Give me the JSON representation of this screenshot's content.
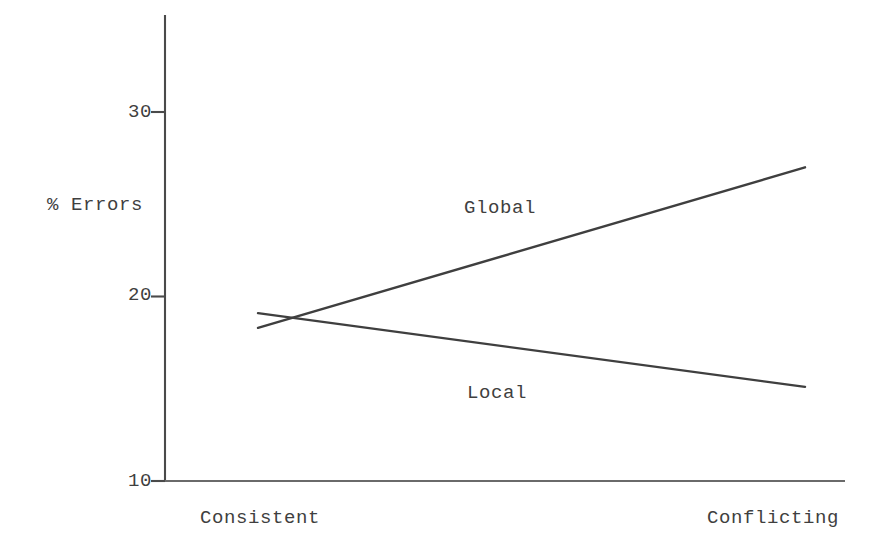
{
  "chart_data": {
    "type": "line",
    "title": "",
    "subtitle": "",
    "xlabel": "",
    "ylabel": "% Errors",
    "categories": [
      "Consistent",
      "Conflicting"
    ],
    "x_tick_labels": [
      "Consistent",
      "Conflicting"
    ],
    "y_tick_labels": [
      "10",
      "20",
      "30"
    ],
    "y_ticks": [
      10,
      20,
      30
    ],
    "ylim": [
      10,
      30
    ],
    "xlim": [
      0,
      1
    ],
    "grid": false,
    "legend": "inline-labels",
    "legend_position": "inline",
    "series": [
      {
        "name": "Global",
        "label": "Global",
        "color": "#3f3f3f",
        "values": [
          18.3,
          27.0
        ],
        "x": [
          "Consistent",
          "Conflicting"
        ]
      },
      {
        "name": "Local",
        "label": "Local",
        "color": "#3f3f3f",
        "values": [
          19.1,
          15.1
        ],
        "x": [
          "Consistent",
          "Conflicting"
        ]
      }
    ],
    "annotations": [
      {
        "text": "Global",
        "series": "Global"
      },
      {
        "text": "Local",
        "series": "Local"
      }
    ]
  },
  "axes": {
    "y_axis_label": "% Errors",
    "y_tick_30": "30",
    "y_tick_20": "20",
    "y_tick_10": "10",
    "x_tick_left": "Consistent",
    "x_tick_right": "Conflicting"
  },
  "series_labels": {
    "global": "Global",
    "local": "Local"
  },
  "colors": {
    "ink": "#3f3f3f",
    "axis": "#555555",
    "background": "#ffffff"
  }
}
